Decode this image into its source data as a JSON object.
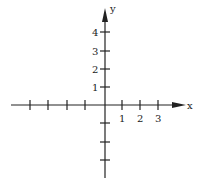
{
  "diagram": {
    "type": "coordinate-axes",
    "axes": {
      "x": {
        "label": "x",
        "tick_labels": [
          "1",
          "2",
          "3"
        ]
      },
      "y": {
        "label": "y",
        "tick_labels": [
          "1",
          "2",
          "3",
          "4"
        ]
      }
    },
    "colors": {
      "axis": "#222222",
      "background": "#ffffff"
    }
  }
}
